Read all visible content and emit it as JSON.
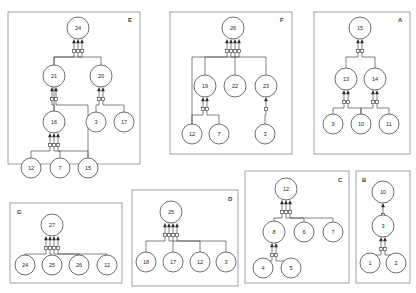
{
  "figure": {
    "background_color": "#ffffff",
    "node_fill": "#ffffff",
    "node_stroke": "#4a4a4a",
    "edge_color": "#4a4a4a",
    "frame_color": "#8a8a8a"
  },
  "panels": [
    {
      "id": "E",
      "letter": "E",
      "frame": {
        "x": 8,
        "y": 12,
        "width": 132,
        "height": 152
      },
      "letter_pos": {
        "x": 128,
        "y": 22
      },
      "nodes": [
        {
          "id": "E24",
          "label": "24",
          "cx": 78,
          "cy": 28,
          "r": 11
        },
        {
          "id": "E21",
          "label": "21",
          "cx": 54,
          "cy": 76,
          "r": 11
        },
        {
          "id": "E20",
          "label": "20",
          "cx": 101,
          "cy": 76,
          "r": 11
        },
        {
          "id": "E16",
          "label": "16",
          "cx": 54,
          "cy": 122,
          "r": 11
        },
        {
          "id": "E3",
          "label": "3",
          "cx": 96,
          "cy": 122,
          "r": 10
        },
        {
          "id": "E17",
          "label": "17",
          "cx": 124,
          "cy": 122,
          "r": 10
        },
        {
          "id": "E12",
          "label": "12",
          "cx": 31,
          "cy": 168,
          "r": 10
        },
        {
          "id": "E7",
          "label": "7",
          "cx": 60,
          "cy": 168,
          "r": 10
        },
        {
          "id": "E15",
          "label": "15",
          "cx": 88,
          "cy": 168,
          "r": 10
        }
      ],
      "edges": [
        {
          "from": "E21",
          "to": "E24"
        },
        {
          "from": "E20",
          "to": "E24"
        },
        {
          "from": "E16",
          "to": "E24"
        },
        {
          "from": "E16",
          "to": "E21"
        },
        {
          "from": "E3",
          "to": "E20"
        },
        {
          "from": "E17",
          "to": "E20"
        },
        {
          "from": "E12",
          "to": "E16"
        },
        {
          "from": "E7",
          "to": "E16"
        },
        {
          "from": "E15",
          "to": "E16"
        },
        {
          "from": "E15",
          "to": "E21"
        }
      ]
    },
    {
      "id": "F",
      "letter": "F",
      "frame": {
        "x": 170,
        "y": 12,
        "width": 122,
        "height": 142
      },
      "letter_pos": {
        "x": 280,
        "y": 22
      },
      "nodes": [
        {
          "id": "F26",
          "label": "26",
          "cx": 233,
          "cy": 28,
          "r": 11
        },
        {
          "id": "F19",
          "label": "19",
          "cx": 205,
          "cy": 86,
          "r": 11
        },
        {
          "id": "F22",
          "label": "22",
          "cx": 235,
          "cy": 86,
          "r": 11
        },
        {
          "id": "F23",
          "label": "23",
          "cx": 266,
          "cy": 86,
          "r": 11
        },
        {
          "id": "F12",
          "label": "12",
          "cx": 192,
          "cy": 134,
          "r": 10
        },
        {
          "id": "F7",
          "label": "7",
          "cx": 219,
          "cy": 134,
          "r": 10
        },
        {
          "id": "F3",
          "label": "3",
          "cx": 265,
          "cy": 134,
          "r": 10
        }
      ],
      "edges": [
        {
          "from": "F19",
          "to": "F26"
        },
        {
          "from": "F22",
          "to": "F26"
        },
        {
          "from": "F23",
          "to": "F26"
        },
        {
          "from": "F12",
          "to": "F19"
        },
        {
          "from": "F7",
          "to": "F19"
        },
        {
          "from": "F12",
          "to": "F26"
        },
        {
          "from": "F3",
          "to": "F23"
        }
      ]
    },
    {
      "id": "A",
      "letter": "A",
      "frame": {
        "x": 314,
        "y": 12,
        "width": 96,
        "height": 142
      },
      "letter_pos": {
        "x": 398,
        "y": 22
      },
      "nodes": [
        {
          "id": "A15",
          "label": "15",
          "cx": 360,
          "cy": 28,
          "r": 11
        },
        {
          "id": "A13",
          "label": "13",
          "cx": 346,
          "cy": 79,
          "r": 11
        },
        {
          "id": "A14",
          "label": "14",
          "cx": 375,
          "cy": 79,
          "r": 11
        },
        {
          "id": "A9",
          "label": "9",
          "cx": 333,
          "cy": 124,
          "r": 10
        },
        {
          "id": "A10",
          "label": "10",
          "cx": 361,
          "cy": 124,
          "r": 10
        },
        {
          "id": "A11",
          "label": "11",
          "cx": 389,
          "cy": 124,
          "r": 10
        }
      ],
      "edges": [
        {
          "from": "A13",
          "to": "A15"
        },
        {
          "from": "A14",
          "to": "A15"
        },
        {
          "from": "A9",
          "to": "A13"
        },
        {
          "from": "A10",
          "to": "A13"
        },
        {
          "from": "A10",
          "to": "A14"
        },
        {
          "from": "A11",
          "to": "A14"
        }
      ]
    },
    {
      "id": "C",
      "letter": "C",
      "frame": {
        "x": 245,
        "y": 171,
        "width": 104,
        "height": 112
      },
      "letter_pos": {
        "x": 338,
        "y": 182
      },
      "nodes": [
        {
          "id": "C12",
          "label": "12",
          "cx": 286,
          "cy": 189,
          "r": 11
        },
        {
          "id": "C8",
          "label": "8",
          "cx": 274,
          "cy": 232,
          "r": 11
        },
        {
          "id": "C6",
          "label": "6",
          "cx": 304,
          "cy": 232,
          "r": 10
        },
        {
          "id": "C7",
          "label": "7",
          "cx": 333,
          "cy": 232,
          "r": 10
        },
        {
          "id": "C4",
          "label": "4",
          "cx": 263,
          "cy": 268,
          "r": 10
        },
        {
          "id": "C5",
          "label": "5",
          "cx": 291,
          "cy": 268,
          "r": 10
        }
      ],
      "edges": [
        {
          "from": "C8",
          "to": "C12"
        },
        {
          "from": "C6",
          "to": "C12"
        },
        {
          "from": "C7",
          "to": "C12"
        },
        {
          "from": "C4",
          "to": "C8"
        },
        {
          "from": "C5",
          "to": "C8"
        }
      ]
    },
    {
      "id": "B",
      "letter": "B",
      "frame": {
        "x": 356,
        "y": 171,
        "width": 54,
        "height": 112
      },
      "letter_pos": {
        "x": 362,
        "y": 182
      },
      "nodes": [
        {
          "id": "B10",
          "label": "10",
          "cx": 383,
          "cy": 192,
          "r": 11
        },
        {
          "id": "B3",
          "label": "3",
          "cx": 383,
          "cy": 226,
          "r": 11
        },
        {
          "id": "B1",
          "label": "1",
          "cx": 370,
          "cy": 263,
          "r": 10
        },
        {
          "id": "B2",
          "label": "2",
          "cx": 396,
          "cy": 263,
          "r": 10
        }
      ],
      "edges": [
        {
          "from": "B3",
          "to": "B10"
        },
        {
          "from": "B1",
          "to": "B3"
        },
        {
          "from": "B2",
          "to": "B3"
        }
      ]
    },
    {
      "id": "D",
      "letter": "D",
      "frame": {
        "x": 132,
        "y": 190,
        "width": 106,
        "height": 96
      },
      "letter_pos": {
        "x": 228,
        "y": 201
      },
      "nodes": [
        {
          "id": "D25",
          "label": "25",
          "cx": 171,
          "cy": 212,
          "r": 11
        },
        {
          "id": "D18",
          "label": "18",
          "cx": 146,
          "cy": 262,
          "r": 10
        },
        {
          "id": "D17",
          "label": "17",
          "cx": 173,
          "cy": 262,
          "r": 10
        },
        {
          "id": "D12",
          "label": "12",
          "cx": 200,
          "cy": 262,
          "r": 10
        },
        {
          "id": "D3",
          "label": "3",
          "cx": 226,
          "cy": 262,
          "r": 10
        }
      ],
      "edges": [
        {
          "from": "D18",
          "to": "D25"
        },
        {
          "from": "D17",
          "to": "D25"
        },
        {
          "from": "D12",
          "to": "D25"
        },
        {
          "from": "D3",
          "to": "D25"
        }
      ]
    },
    {
      "id": "G",
      "letter": "G",
      "frame": {
        "x": 10,
        "y": 203,
        "width": 112,
        "height": 80
      },
      "letter_pos": {
        "x": 17,
        "y": 214
      },
      "nodes": [
        {
          "id": "G27",
          "label": "27",
          "cx": 52,
          "cy": 225,
          "r": 11
        },
        {
          "id": "G24",
          "label": "24",
          "cx": 25,
          "cy": 265,
          "r": 10
        },
        {
          "id": "G25",
          "label": "25",
          "cx": 52,
          "cy": 265,
          "r": 10
        },
        {
          "id": "G26",
          "label": "26",
          "cx": 79,
          "cy": 265,
          "r": 10
        },
        {
          "id": "G12",
          "label": "12",
          "cx": 107,
          "cy": 265,
          "r": 10
        }
      ],
      "edges": [
        {
          "from": "G24",
          "to": "G27"
        },
        {
          "from": "G25",
          "to": "G27"
        },
        {
          "from": "G26",
          "to": "G27"
        },
        {
          "from": "G12",
          "to": "G27"
        }
      ]
    }
  ]
}
